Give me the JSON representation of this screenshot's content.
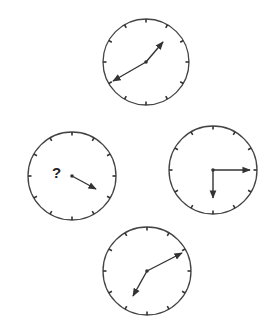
{
  "colors": {
    "stroke": "#333333",
    "face": "#ffffff",
    "background": "#ffffff"
  },
  "clocks": [
    {
      "id": "top",
      "cx": 146,
      "cy": 62,
      "r": 43,
      "hands": [
        {
          "name": "minute",
          "x": 163,
          "y": 42
        },
        {
          "name": "hour",
          "x": 113,
          "y": 81
        }
      ],
      "center_dot": true
    },
    {
      "id": "left",
      "cx": 72,
      "cy": 176,
      "r": 44,
      "hands": [
        {
          "name": "single",
          "x": 96,
          "y": 189
        }
      ],
      "center_dot": true,
      "unknown": true,
      "label": "?",
      "label_x": 52,
      "label_y": 178
    },
    {
      "id": "right",
      "cx": 213,
      "cy": 170,
      "r": 44,
      "hands": [
        {
          "name": "minute",
          "x": 250,
          "y": 170
        },
        {
          "name": "hour",
          "x": 213,
          "y": 198
        }
      ],
      "center_dot": true
    },
    {
      "id": "bottom",
      "cx": 147,
      "cy": 271,
      "r": 44,
      "hands": [
        {
          "name": "minute",
          "x": 182,
          "y": 253
        },
        {
          "name": "hour",
          "x": 133,
          "y": 296
        }
      ],
      "center_dot": true
    }
  ],
  "ticks_per_clock": 12
}
